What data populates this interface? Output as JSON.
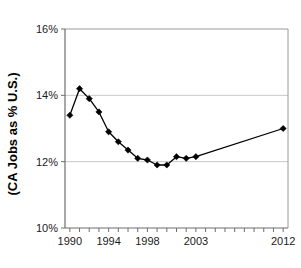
{
  "chart_data": {
    "type": "line",
    "title": "",
    "xlabel": "",
    "ylabel": "(CA Jobs as % U.S.)",
    "ylim": [
      10,
      16
    ],
    "xlim": [
      1989.5,
      2012.5
    ],
    "grid": true,
    "legend": null,
    "ytick_labels": [
      "16%",
      "14%",
      "12%",
      "10%"
    ],
    "ytick_values": [
      16,
      14,
      12,
      10
    ],
    "xtick_labels": [
      "1990",
      "1994",
      "1998",
      "2003",
      "2012"
    ],
    "xtick_values": [
      1990,
      1994,
      1998,
      2003,
      2012
    ],
    "xtick_all_values": [
      1990,
      1991,
      1992,
      1993,
      1994,
      1995,
      1996,
      1997,
      1998,
      1999,
      2000,
      2001,
      2002,
      2003,
      2004,
      2005,
      2006,
      2007,
      2008,
      2009,
      2010,
      2011,
      2012
    ],
    "marker": "diamond",
    "series": [
      {
        "name": "CA Jobs as % U.S.",
        "x": [
          1990,
          1991,
          1992,
          1993,
          1994,
          1995,
          1996,
          1997,
          1998,
          1999,
          2000,
          2001,
          2002,
          2003,
          2012
        ],
        "values": [
          13.4,
          14.2,
          13.9,
          13.5,
          12.9,
          12.6,
          12.35,
          12.1,
          12.05,
          11.9,
          11.9,
          12.15,
          12.1,
          12.15,
          13.0
        ]
      }
    ]
  },
  "axis": {
    "y_title": "(CA Jobs as % U.S.)"
  },
  "colors": {
    "series": "#000000",
    "grid": "#c8c8c8",
    "frame": "#9a9a9a",
    "axis": "#6e6e6e",
    "background": "#ffffff"
  }
}
